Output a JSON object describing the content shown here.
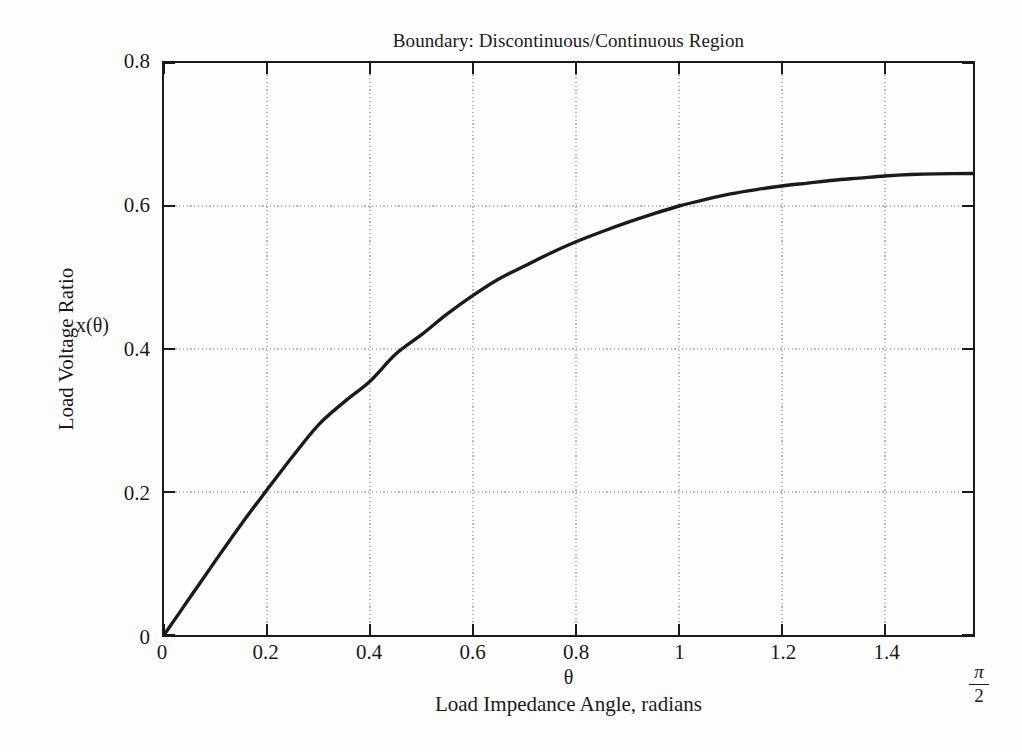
{
  "chart_data": {
    "type": "line",
    "title": "Boundary: Discontinuous/Continuous Region",
    "xlabel": "Load Impedance Angle, radians",
    "xsymbol": "θ",
    "ylabel": "Load Voltage Ratio",
    "ysymbol": "x(θ)",
    "xlim": [
      0,
      1.5707963
    ],
    "ylim": [
      0,
      0.8
    ],
    "grid": true,
    "legend": null,
    "legend_position": "none",
    "line_color": "#1a1a1a",
    "grid_color": "#b8b8b8",
    "axis_color": "#1a1a1a",
    "background_color": "#fdfdfd",
    "xticks": [
      0,
      0.2,
      0.4,
      0.6,
      0.8,
      1,
      1.2,
      1.4
    ],
    "xtick_labels": [
      "0",
      "0.2",
      "0.4",
      "0.6",
      "0.8",
      "1",
      "1.2",
      "1.4"
    ],
    "x_end_label": {
      "numerator": "π",
      "denominator": "2"
    },
    "yticks": [
      0,
      0.2,
      0.4,
      0.6,
      0.8
    ],
    "ytick_labels": [
      "0",
      "0.2",
      "0.4",
      "0.6",
      "0.8"
    ],
    "series": [
      {
        "name": "x(θ)",
        "x": [
          0.0,
          0.05,
          0.1,
          0.15,
          0.2,
          0.25,
          0.3,
          0.35,
          0.4,
          0.45,
          0.5,
          0.55,
          0.6,
          0.65,
          0.7,
          0.75,
          0.8,
          0.85,
          0.9,
          0.95,
          1.0,
          1.05,
          1.1,
          1.15,
          1.2,
          1.25,
          1.3,
          1.35,
          1.4,
          1.45,
          1.5,
          1.5707963
        ],
        "values": [
          0.0,
          0.052,
          0.104,
          0.155,
          0.203,
          0.25,
          0.294,
          0.326,
          0.355,
          0.393,
          0.42,
          0.449,
          0.475,
          0.498,
          0.516,
          0.534,
          0.55,
          0.564,
          0.577,
          0.589,
          0.6,
          0.609,
          0.617,
          0.623,
          0.628,
          0.632,
          0.636,
          0.639,
          0.642,
          0.644,
          0.645,
          0.6455
        ]
      }
    ]
  },
  "axis_symbols": {
    "y_symbol_text": "x(θ)"
  }
}
